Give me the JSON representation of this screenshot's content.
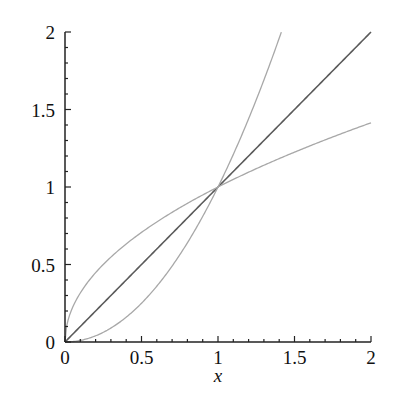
{
  "chart_data": {
    "type": "line",
    "title": "",
    "xlabel": "x",
    "ylabel": "",
    "xlim": [
      0,
      2
    ],
    "ylim": [
      0,
      2
    ],
    "grid": false,
    "legend": null,
    "x_ticks": [
      "0",
      "0.5",
      "1",
      "1.5",
      "2"
    ],
    "y_ticks": [
      "0",
      "0.5",
      "1",
      "1.5",
      "2"
    ],
    "minor_tick_step": 0.1,
    "series": [
      {
        "name": "y = x",
        "color": "#5a5a5a",
        "x": [
          0,
          0.5,
          1,
          1.5,
          2
        ],
        "y": [
          0,
          0.5,
          1,
          1.5,
          2
        ]
      },
      {
        "name": "y = x^2",
        "color": "#a8a8a8",
        "x": [
          0,
          0.25,
          0.5,
          0.75,
          1,
          1.25,
          1.414
        ],
        "y": [
          0,
          0.0625,
          0.25,
          0.5625,
          1,
          1.5625,
          2
        ]
      },
      {
        "name": "y = sqrt(x)",
        "color": "#a8a8a8",
        "x": [
          0,
          0.25,
          0.5,
          1,
          1.5,
          2
        ],
        "y": [
          0,
          0.5,
          0.707,
          1,
          1.225,
          1.414
        ]
      }
    ]
  }
}
